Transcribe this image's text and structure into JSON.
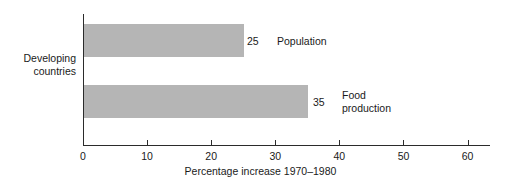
{
  "chart_data": {
    "type": "bar",
    "orientation": "horizontal",
    "title": "",
    "xlabel": "Percentage increase 1970–1980",
    "ylabel": "Developing countries",
    "categories": [
      "Population",
      "Food production"
    ],
    "values": [
      25,
      35
    ],
    "value_labels": [
      "25",
      "35"
    ],
    "xlim": [
      0,
      63.5
    ],
    "ticks": [
      0,
      10,
      20,
      30,
      40,
      50,
      60
    ],
    "tick_labels": [
      "0",
      "10",
      "20",
      "30",
      "40",
      "50",
      "60"
    ],
    "grid": false,
    "legend": "none",
    "bar_color": "#b5b5b5",
    "axis_color": "#2b2b2b",
    "text_color": "#1a1a1a",
    "background": "#ffffff"
  },
  "category_label": {
    "line1": "Developing",
    "line2": "countries"
  },
  "series": [
    {
      "name": "population",
      "value_label": "25",
      "label_line1": "Population",
      "label_line2": ""
    },
    {
      "name": "food-production",
      "value_label": "35",
      "label_line1": "Food",
      "label_line2": "production"
    }
  ],
  "axis": {
    "title": "Percentage increase 1970–1980",
    "ticks": [
      "0",
      "10",
      "20",
      "30",
      "40",
      "50",
      "60"
    ]
  }
}
